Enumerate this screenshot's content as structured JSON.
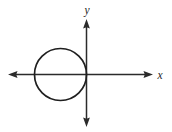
{
  "figure": {
    "background_color": "#ffffff",
    "stroke_color": "#1f1f1f",
    "axis_color": "#2b2b2b",
    "width": 172,
    "height": 132,
    "x_axis_label": "x",
    "y_axis_label": "y"
  },
  "chart_data": {
    "type": "scatter",
    "title": "",
    "xlabel": "x",
    "ylabel": "y",
    "grid": false,
    "legend": null,
    "axes": {
      "origin_px": {
        "x": 86.5,
        "y": 74.5
      },
      "x_axis": {
        "orientation": "horizontal",
        "arrowheads": "both",
        "start_px": {
          "x": 8,
          "y": 74.5
        },
        "end_px": {
          "x": 153,
          "y": 74.5
        },
        "label": "x",
        "label_position": "right-end"
      },
      "y_axis": {
        "orientation": "vertical",
        "arrowheads": "both",
        "start_px": {
          "x": 86.5,
          "y": 19
        },
        "end_px": {
          "x": 86.5,
          "y": 127
        },
        "label": "y",
        "label_position": "top-end"
      },
      "tick_labels": [],
      "xlim": null,
      "ylim": null
    },
    "shapes": [
      {
        "kind": "circle",
        "center_px": {
          "x": 60.5,
          "y": 74.5
        },
        "radius_px": 26,
        "center_units": {
          "x": -1,
          "y": 0
        },
        "radius_units": 1,
        "filled": false,
        "stroke": "#1f1f1f",
        "stroke_width": 1.7,
        "note": "tangent to the y-axis at the origin; centered on the x-axis in the second and third quadrants"
      }
    ],
    "annotations": []
  }
}
